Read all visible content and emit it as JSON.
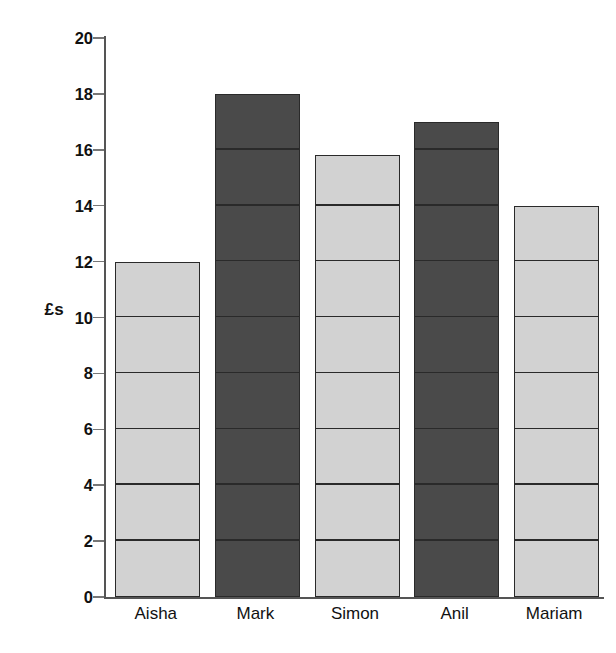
{
  "chart_data": {
    "type": "bar",
    "title": "",
    "xlabel": "",
    "ylabel": "£s",
    "categories": [
      "Aisha",
      "Mark",
      "Simon",
      "Anil",
      "Mariam"
    ],
    "values": [
      12,
      18,
      15.8,
      17,
      14
    ],
    "ylim": [
      0,
      20
    ],
    "ytick_step": 2,
    "yticks": [
      0,
      2,
      4,
      6,
      8,
      10,
      12,
      14,
      16,
      18,
      20
    ],
    "ytick_labels": [
      "0",
      "2",
      "4",
      "6",
      "8",
      "10",
      "12",
      "14",
      "16",
      "18",
      "20"
    ],
    "grid": false,
    "legend": null,
    "bar_segment_interval": 2,
    "series": [
      {
        "name": "Pocket money",
        "values": [
          12,
          18,
          15.8,
          17,
          14
        ]
      }
    ],
    "bar_styles": [
      "light",
      "dark",
      "light",
      "dark",
      "light"
    ],
    "colors": {
      "bar_light": "#d2d2d2",
      "bar_dark": "#4a4a4a",
      "bar_outline": "#2a2a2a",
      "axis": "#555555",
      "text": "#111111",
      "background": "#ffffff"
    }
  }
}
